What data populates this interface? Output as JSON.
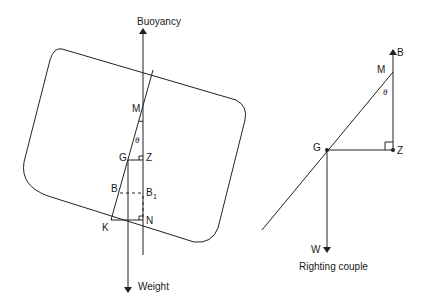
{
  "left_figure": {
    "title": "Heeled vessel cross-section",
    "labels": {
      "buoyancy": "Buoyancy",
      "weight": "Weight",
      "M": "M",
      "theta": "θ",
      "G": "G",
      "Z": "Z",
      "B": "B",
      "B1_main": "B",
      "B1_sub": "1",
      "N": "N",
      "K": "K"
    }
  },
  "right_figure": {
    "caption": "Righting couple",
    "labels": {
      "B": "B",
      "M": "M",
      "theta": "θ",
      "G": "G",
      "Z": "Z",
      "W": "W"
    }
  },
  "colors": {
    "line": "#222222",
    "background": "#ffffff"
  }
}
